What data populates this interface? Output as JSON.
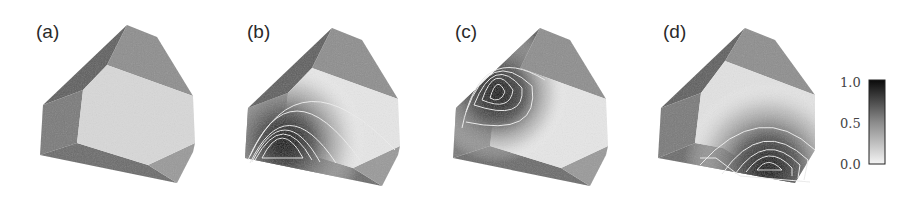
{
  "figure": {
    "panels": [
      {
        "label": "(a)",
        "description": "Truncated polyhedron, uniform shading (no field)",
        "hotspot": null
      },
      {
        "label": "(b)",
        "description": "Intensity field concentrated at lower-left corner of front face",
        "hotspot": {
          "x": 285,
          "y": 142
        }
      },
      {
        "label": "(c)",
        "description": "Intensity field concentrated at upper-left edge",
        "hotspot": {
          "x": 497,
          "y": 93
        }
      },
      {
        "label": "(d)",
        "description": "Intensity field concentrated at bottom-right region",
        "hotspot": {
          "x": 768,
          "y": 167
        }
      }
    ],
    "colorbar": {
      "ticks": [
        "1.0",
        "0.5",
        "0.0"
      ],
      "min": 0.0,
      "max": 1.0,
      "colormap": "white-to-black (grayscale)"
    },
    "colors": {
      "face_light": "#d8d8d8",
      "face_top": "#8e8e8e",
      "face_dark": "#5e5e5e",
      "face_left": "#7a7a7a",
      "face_bottom": "#6c6c6c",
      "face_bottom_right": "#9a9a9a",
      "contour_line": "#e8e8e8",
      "hot": "#0a0a0a"
    }
  }
}
